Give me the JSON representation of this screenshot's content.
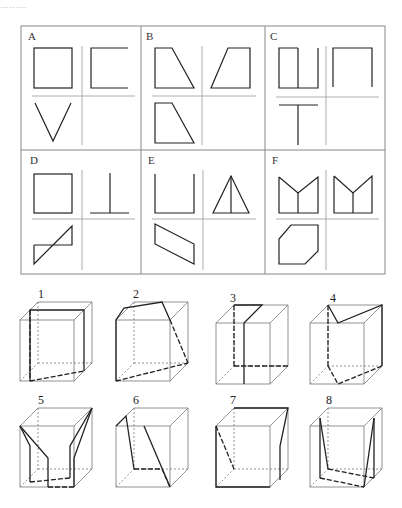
{
  "header": {
    "caption": "………"
  },
  "grid": {
    "panels": [
      {
        "label": "A",
        "views": [
          "square",
          "C-bracket",
          "V-shape",
          "empty"
        ]
      },
      {
        "label": "B",
        "views": [
          "right-trapezoid",
          "left-trapezoid",
          "right-trapezoid",
          "empty"
        ]
      },
      {
        "label": "C",
        "views": [
          "square-with-center-line",
          "inverted-U",
          "T-shape",
          "empty"
        ]
      },
      {
        "label": "D",
        "views": [
          "square",
          "inverted-T",
          "parallelogram-diagonal",
          "empty"
        ]
      },
      {
        "label": "E",
        "views": [
          "U-shape",
          "triangle-with-median",
          "parallelogram",
          "empty"
        ]
      },
      {
        "label": "F",
        "views": [
          "M-shape",
          "M-shape",
          "chamfered-hexagon",
          "empty"
        ]
      }
    ]
  },
  "cubes": {
    "items": [
      {
        "label": "1"
      },
      {
        "label": "2"
      },
      {
        "label": "3"
      },
      {
        "label": "4"
      },
      {
        "label": "5"
      },
      {
        "label": "6"
      },
      {
        "label": "7"
      },
      {
        "label": "8"
      }
    ]
  },
  "colors": {
    "line": "#222222",
    "frame": "#888888",
    "cube_edge": "#666666"
  }
}
